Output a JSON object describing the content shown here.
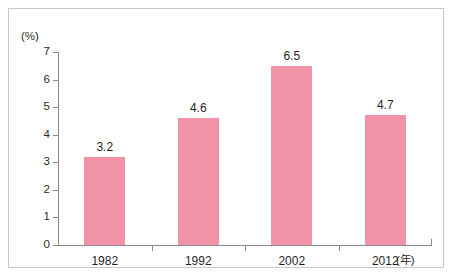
{
  "chart_data": {
    "type": "bar",
    "title": "",
    "subtitle": "",
    "xlabel": "(年)",
    "ylabel": "(%)",
    "categories": [
      "1982",
      "1992",
      "2002",
      "2012"
    ],
    "values": [
      3.2,
      4.6,
      6.5,
      4.7
    ],
    "value_labels": [
      "3.2",
      "4.6",
      "6.5",
      "4.7"
    ],
    "series": [
      {
        "name": "",
        "values": [
          3.2,
          4.6,
          6.5,
          4.7
        ],
        "color": "#f193a6"
      }
    ],
    "ylim": [
      0,
      7
    ],
    "yticks": [
      0,
      1,
      2,
      3,
      4,
      5,
      6,
      7
    ],
    "ytick_labels": [
      "0",
      "1",
      "2",
      "3",
      "4",
      "5",
      "6",
      "7"
    ],
    "grid": false,
    "legend": null,
    "annotations": []
  },
  "axis": {
    "y_unit": "(%)",
    "x_unit": "(年)",
    "line_color": "#8a8a8a"
  },
  "style": {
    "bar_color": "#f193a6",
    "border_color": "#c8c8c8",
    "background": "#ffffff",
    "text_color": "#1f1f1f"
  }
}
